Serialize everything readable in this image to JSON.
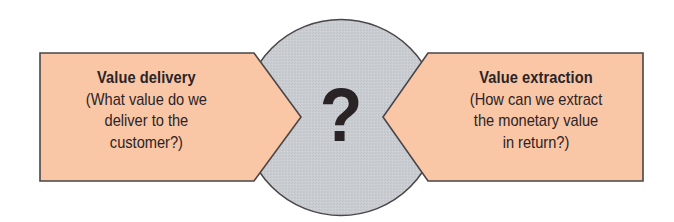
{
  "diagram": {
    "colors": {
      "box_fill": "#f9c6a6",
      "circle_fill": "#c9ccd0",
      "outline": "#4a4548",
      "text": "#2b2426"
    },
    "center": {
      "symbol": "?",
      "shape": "circle"
    },
    "left_box": {
      "title": "Value delivery",
      "lines": [
        "(What value do we",
        "deliver to the",
        "customer?)"
      ],
      "arrow_direction": "right"
    },
    "right_box": {
      "title": "Value extraction",
      "lines": [
        "(How can we extract",
        "the monetary value",
        "in return?)"
      ],
      "arrow_direction": "left"
    }
  }
}
